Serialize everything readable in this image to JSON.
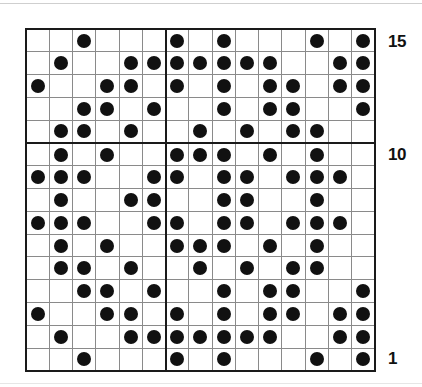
{
  "chart_data": {
    "type": "heatmap",
    "title": "",
    "subtitle": "",
    "xlabel": "",
    "ylabel": "",
    "columns": 15,
    "rows": 15,
    "legend": [],
    "grid": true,
    "axis_ranges": {
      "x": [
        1,
        15
      ],
      "y": [
        1,
        15
      ]
    },
    "visible_row_labels": [
      "15",
      "10",
      "1"
    ],
    "row_label_positions": [
      15,
      10,
      1
    ],
    "row_label_side": "right",
    "heavy_divider_columns": [
      6
    ],
    "heavy_divider_rows": [
      10
    ],
    "cell_symbols": {
      "filled": "dot",
      "empty": "blank"
    },
    "colors": {
      "dot": "#111111",
      "grid_line": "#8a8a8a",
      "heavy_line": "#1a1a1a",
      "background": "#ffffff",
      "label": "#111111"
    },
    "row_order_top_to_bottom": [
      15,
      14,
      13,
      12,
      11,
      10,
      9,
      8,
      7,
      6,
      5,
      4,
      3,
      2,
      1
    ],
    "filled_cells_by_row": {
      "15": [
        3,
        7,
        9,
        13,
        15
      ],
      "14": [
        2,
        5,
        6,
        7,
        8,
        9,
        10,
        11,
        14,
        15
      ],
      "13": [
        1,
        4,
        5,
        7,
        9,
        11,
        12,
        14,
        15
      ],
      "12": [
        3,
        4,
        6,
        9,
        11,
        12,
        15
      ],
      "11": [
        2,
        3,
        5,
        8,
        10,
        12,
        13
      ],
      "10": [
        2,
        4,
        7,
        8,
        9,
        11,
        13
      ],
      "9": [
        1,
        2,
        3,
        6,
        7,
        9,
        10,
        12,
        13,
        14
      ],
      "8": [
        2,
        5,
        6,
        9,
        10,
        13
      ],
      "7": [
        1,
        2,
        3,
        6,
        7,
        9,
        10,
        12,
        13,
        14
      ],
      "6": [
        2,
        4,
        7,
        8,
        9,
        11,
        13
      ],
      "5": [
        2,
        3,
        5,
        8,
        10,
        12,
        13
      ],
      "4": [
        3,
        4,
        6,
        9,
        11,
        12,
        15
      ],
      "3": [
        1,
        4,
        5,
        7,
        9,
        11,
        12,
        14,
        15
      ],
      "2": [
        2,
        5,
        6,
        7,
        8,
        9,
        10,
        11,
        14,
        15
      ],
      "1": [
        3,
        7,
        9,
        13,
        15
      ]
    },
    "matrix_top_to_bottom": [
      [
        0,
        0,
        1,
        0,
        0,
        0,
        1,
        0,
        1,
        0,
        0,
        0,
        1,
        0,
        1
      ],
      [
        0,
        1,
        0,
        0,
        1,
        1,
        1,
        1,
        1,
        1,
        1,
        0,
        0,
        1,
        1
      ],
      [
        1,
        0,
        0,
        1,
        1,
        0,
        1,
        0,
        1,
        0,
        1,
        1,
        0,
        1,
        1
      ],
      [
        0,
        0,
        1,
        1,
        0,
        1,
        0,
        0,
        1,
        0,
        1,
        1,
        0,
        0,
        1
      ],
      [
        0,
        1,
        1,
        0,
        1,
        0,
        0,
        1,
        0,
        1,
        0,
        1,
        1,
        0,
        0
      ],
      [
        0,
        1,
        0,
        1,
        0,
        0,
        1,
        1,
        1,
        0,
        1,
        0,
        1,
        0,
        0
      ],
      [
        1,
        1,
        1,
        0,
        0,
        1,
        1,
        0,
        1,
        1,
        0,
        1,
        1,
        1,
        0
      ],
      [
        0,
        1,
        0,
        0,
        1,
        1,
        0,
        0,
        1,
        1,
        0,
        0,
        1,
        0,
        0
      ],
      [
        1,
        1,
        1,
        0,
        0,
        1,
        1,
        0,
        1,
        1,
        0,
        1,
        1,
        1,
        0
      ],
      [
        0,
        1,
        0,
        1,
        0,
        0,
        1,
        1,
        1,
        0,
        1,
        0,
        1,
        0,
        0
      ],
      [
        0,
        1,
        1,
        0,
        1,
        0,
        0,
        1,
        0,
        1,
        0,
        1,
        1,
        0,
        0
      ],
      [
        0,
        0,
        1,
        1,
        0,
        1,
        0,
        0,
        1,
        0,
        1,
        1,
        0,
        0,
        1
      ],
      [
        1,
        0,
        0,
        1,
        1,
        0,
        1,
        0,
        1,
        0,
        1,
        1,
        0,
        1,
        1
      ],
      [
        0,
        1,
        0,
        0,
        1,
        1,
        1,
        1,
        1,
        1,
        1,
        0,
        0,
        1,
        1
      ],
      [
        0,
        0,
        1,
        0,
        0,
        0,
        1,
        0,
        1,
        0,
        0,
        0,
        1,
        0,
        1
      ]
    ]
  },
  "labels": {
    "top": "15",
    "middle": "10",
    "bottom": "1"
  }
}
